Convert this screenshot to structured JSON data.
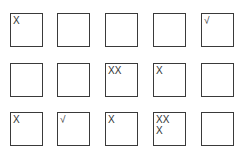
{
  "grid": {
    "rows": 3,
    "columns": 5,
    "border_color": "#3a3a3a",
    "mark_color": "#333333",
    "cells": [
      [
        {
          "mark": "X"
        },
        {
          "mark": ""
        },
        {
          "mark": ""
        },
        {
          "mark": ""
        },
        {
          "mark": "√"
        }
      ],
      [
        {
          "mark": ""
        },
        {
          "mark": ""
        },
        {
          "mark": "XX"
        },
        {
          "mark": "X"
        },
        {
          "mark": ""
        }
      ],
      [
        {
          "mark": "X"
        },
        {
          "mark": "√"
        },
        {
          "mark": "X"
        },
        {
          "mark": "XX\nX"
        },
        {
          "mark": ""
        }
      ]
    ]
  }
}
